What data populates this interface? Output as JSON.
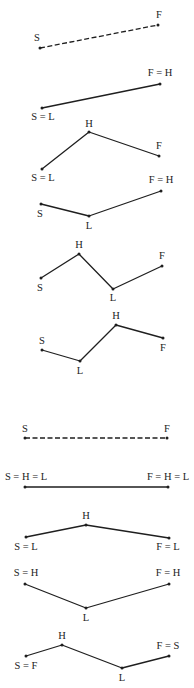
{
  "figure": {
    "diagrams": [
      {
        "id": "d1",
        "style": "dashed",
        "points": [
          {
            "key": "S",
            "label": "S"
          },
          {
            "key": "F",
            "label": "F"
          }
        ]
      },
      {
        "id": "d2",
        "style": "solid",
        "points": [
          {
            "key": "S",
            "label": "S = L"
          },
          {
            "key": "F",
            "label": "F = H"
          }
        ]
      },
      {
        "id": "d3",
        "style": "solid",
        "points": [
          {
            "key": "S",
            "label": "S = L"
          },
          {
            "key": "H",
            "label": "H"
          },
          {
            "key": "F",
            "label": "F"
          }
        ]
      },
      {
        "id": "d4",
        "style": "solid",
        "points": [
          {
            "key": "S",
            "label": "S"
          },
          {
            "key": "L",
            "label": "L"
          },
          {
            "key": "F",
            "label": "F = H"
          }
        ]
      },
      {
        "id": "d5",
        "style": "solid",
        "points": [
          {
            "key": "S",
            "label": "S"
          },
          {
            "key": "H",
            "label": "H"
          },
          {
            "key": "L",
            "label": "L"
          },
          {
            "key": "F",
            "label": "F"
          }
        ]
      },
      {
        "id": "d6",
        "style": "solid",
        "points": [
          {
            "key": "S",
            "label": "S"
          },
          {
            "key": "L",
            "label": "L"
          },
          {
            "key": "H",
            "label": "H"
          },
          {
            "key": "F",
            "label": "F"
          }
        ]
      },
      {
        "id": "d7",
        "style": "dashed",
        "points": [
          {
            "key": "S",
            "label": "S"
          },
          {
            "key": "F",
            "label": "F"
          }
        ]
      },
      {
        "id": "d8",
        "style": "solid",
        "points": [
          {
            "key": "S",
            "label": "S = H = L"
          },
          {
            "key": "F",
            "label": "F = H = L"
          }
        ]
      },
      {
        "id": "d9",
        "style": "solid",
        "points": [
          {
            "key": "S",
            "label": "S = L"
          },
          {
            "key": "H",
            "label": "H"
          },
          {
            "key": "F",
            "label": "F = L"
          }
        ]
      },
      {
        "id": "d10",
        "style": "solid",
        "points": [
          {
            "key": "S",
            "label": "S = H"
          },
          {
            "key": "L",
            "label": "L"
          },
          {
            "key": "F",
            "label": "F = H"
          }
        ]
      },
      {
        "id": "d11",
        "style": "solid",
        "points": [
          {
            "key": "S",
            "label": "S = F"
          },
          {
            "key": "H",
            "label": "H"
          },
          {
            "key": "L",
            "label": "L"
          },
          {
            "key": "F",
            "label": "F = S"
          }
        ]
      }
    ]
  }
}
